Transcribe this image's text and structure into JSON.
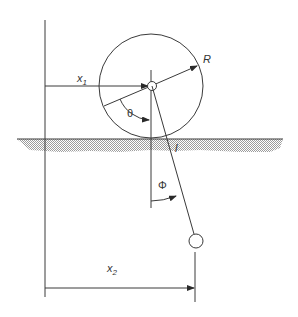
{
  "diagram": {
    "labels": {
      "x1": "x",
      "x1_sub": "1",
      "x2": "x",
      "x2_sub": "2",
      "R": "R",
      "theta": "θ",
      "l": "l",
      "phi": "Φ"
    },
    "colors": {
      "line": "#3a3a3a",
      "hatch": "#9a9a9a",
      "background": "#ffffff"
    }
  }
}
